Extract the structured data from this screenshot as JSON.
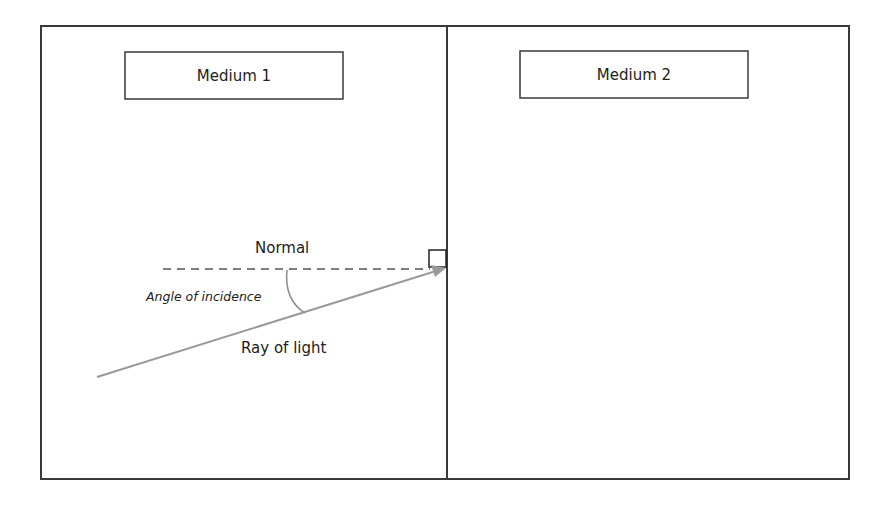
{
  "diagram": {
    "colors": {
      "border": "#3a3a3a",
      "ray": "#9a9a9a",
      "normal": "#555555",
      "background": "#ffffff"
    },
    "media": [
      {
        "label": "Medium 1"
      },
      {
        "label": "Medium 2"
      }
    ],
    "labels": {
      "normal": "Normal",
      "angle": "Angle of incidence",
      "ray": "Ray of light"
    }
  }
}
